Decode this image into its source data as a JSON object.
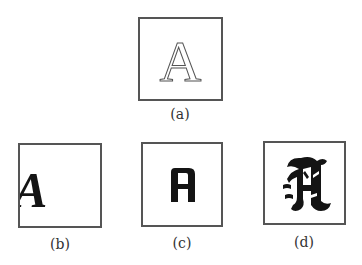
{
  "figure": {
    "panels": [
      {
        "id": "a",
        "glyph": "A",
        "style": "outlined serif",
        "caption": "(a)"
      },
      {
        "id": "b",
        "glyph": "A",
        "style": "bold italic serif",
        "caption": "(b)"
      },
      {
        "id": "c",
        "glyph": "A",
        "style": "condensed heavy sans",
        "caption": "(c)"
      },
      {
        "id": "d",
        "glyph": "A",
        "style": "blackletter",
        "caption": "(d)"
      }
    ]
  },
  "colors": {
    "border": "#555555",
    "glyph": "#141414",
    "background": "#ffffff"
  }
}
